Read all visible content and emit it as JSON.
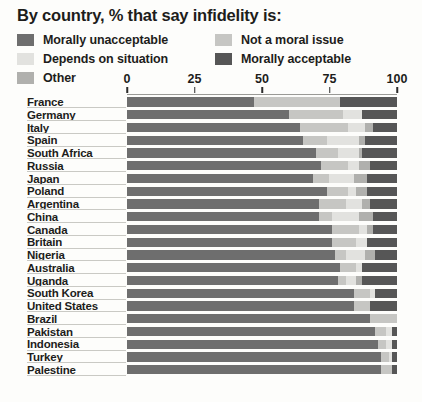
{
  "title": "By country, % that say infidelity is:",
  "legend": {
    "left": [
      {
        "label": "Morally unacceptable",
        "key": "unacceptable",
        "color": "#6e6e6e"
      },
      {
        "label": "Depends on situation",
        "key": "depends",
        "color": "#e2e2df"
      },
      {
        "label": "Other",
        "key": "other",
        "color": "#b0b0ad"
      }
    ],
    "right": [
      {
        "label": "Not a moral issue",
        "key": "not_moral",
        "color": "#c6c6c3"
      },
      {
        "label": "Morally acceptable",
        "key": "acceptable",
        "color": "#565656"
      }
    ]
  },
  "axis": {
    "ticks": [
      0,
      25,
      50,
      75,
      100
    ],
    "tick_labels": [
      "0",
      "25",
      "50",
      "75",
      "100"
    ],
    "min": 0,
    "max": 100
  },
  "colors": {
    "unacceptable": "#6e6e6e",
    "not_moral": "#c6c6c3",
    "depends": "#e2e2df",
    "other": "#b0b0ad",
    "acceptable": "#565656",
    "background": "#fdfdfb",
    "text": "#1d1d1b",
    "rule": "#c9c9c4"
  },
  "chart_data": {
    "type": "bar",
    "orientation": "horizontal",
    "stacked": true,
    "normalized": true,
    "title": "By country, % that say infidelity is:",
    "xlabel": "",
    "ylabel": "",
    "xlim": [
      0,
      100
    ],
    "grid": false,
    "legend_position": "top",
    "series_order": [
      "unacceptable",
      "not_moral",
      "depends",
      "other",
      "acceptable"
    ],
    "series_labels": {
      "unacceptable": "Morally unacceptable",
      "not_moral": "Not a moral issue",
      "depends": "Depends on situation",
      "other": "Other",
      "acceptable": "Morally acceptable"
    },
    "categories": [
      "France",
      "Germany",
      "Italy",
      "Spain",
      "South Africa",
      "Russia",
      "Japan",
      "Poland",
      "Argentina",
      "China",
      "Canada",
      "Britain",
      "Nigeria",
      "Australia",
      "Uganda",
      "South Korea",
      "United States",
      "Brazil",
      "Pakistan",
      "Indonesia",
      "Turkey",
      "Palestine"
    ],
    "rows": [
      {
        "country": "France",
        "unacceptable": 47,
        "not_moral": 32,
        "depends": 0,
        "other": 0,
        "acceptable": 21
      },
      {
        "country": "Germany",
        "unacceptable": 60,
        "not_moral": 20,
        "depends": 7,
        "other": 0,
        "acceptable": 13
      },
      {
        "country": "Italy",
        "unacceptable": 64,
        "not_moral": 18,
        "depends": 6,
        "other": 3,
        "acceptable": 9
      },
      {
        "country": "Spain",
        "unacceptable": 65,
        "not_moral": 9,
        "depends": 12,
        "other": 2,
        "acceptable": 12
      },
      {
        "country": "South Africa",
        "unacceptable": 70,
        "not_moral": 8,
        "depends": 8,
        "other": 1,
        "acceptable": 13
      },
      {
        "country": "Russia",
        "unacceptable": 72,
        "not_moral": 10,
        "depends": 4,
        "other": 4,
        "acceptable": 10
      },
      {
        "country": "Japan",
        "unacceptable": 69,
        "not_moral": 6,
        "depends": 9,
        "other": 5,
        "acceptable": 11
      },
      {
        "country": "Poland",
        "unacceptable": 74,
        "not_moral": 8,
        "depends": 3,
        "other": 4,
        "acceptable": 11
      },
      {
        "country": "Argentina",
        "unacceptable": 71,
        "not_moral": 10,
        "depends": 6,
        "other": 3,
        "acceptable": 10
      },
      {
        "country": "China",
        "unacceptable": 71,
        "not_moral": 5,
        "depends": 10,
        "other": 5,
        "acceptable": 9
      },
      {
        "country": "Canada",
        "unacceptable": 76,
        "not_moral": 10,
        "depends": 3,
        "other": 2,
        "acceptable": 9
      },
      {
        "country": "Britain",
        "unacceptable": 76,
        "not_moral": 9,
        "depends": 4,
        "other": 0,
        "acceptable": 11
      },
      {
        "country": "Nigeria",
        "unacceptable": 77,
        "not_moral": 4,
        "depends": 7,
        "other": 4,
        "acceptable": 8
      },
      {
        "country": "Australia",
        "unacceptable": 79,
        "not_moral": 6,
        "depends": 2,
        "other": 0,
        "acceptable": 13
      },
      {
        "country": "Uganda",
        "unacceptable": 78,
        "not_moral": 3,
        "depends": 4,
        "other": 2,
        "acceptable": 13
      },
      {
        "country": "South Korea",
        "unacceptable": 84,
        "not_moral": 6,
        "depends": 2,
        "other": 0,
        "acceptable": 8
      },
      {
        "country": "United States",
        "unacceptable": 84,
        "not_moral": 6,
        "depends": 0,
        "other": 0,
        "acceptable": 10
      },
      {
        "country": "Brazil",
        "unacceptable": 90,
        "not_moral": 10,
        "depends": 0,
        "other": 0,
        "acceptable": 0
      },
      {
        "country": "Pakistan",
        "unacceptable": 92,
        "not_moral": 4,
        "depends": 2,
        "other": 0,
        "acceptable": 2
      },
      {
        "country": "Indonesia",
        "unacceptable": 93,
        "not_moral": 3,
        "depends": 2,
        "other": 0,
        "acceptable": 2
      },
      {
        "country": "Turkey",
        "unacceptable": 94,
        "not_moral": 3,
        "depends": 1,
        "other": 0,
        "acceptable": 2
      },
      {
        "country": "Palestine",
        "unacceptable": 94,
        "not_moral": 4,
        "depends": 0,
        "other": 0,
        "acceptable": 2
      }
    ]
  }
}
